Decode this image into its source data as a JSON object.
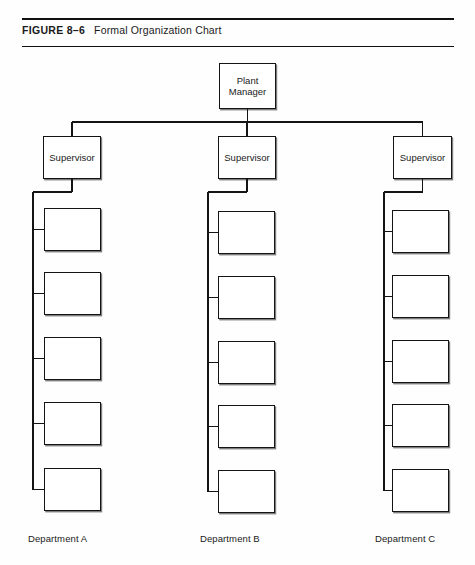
{
  "caption": {
    "figure_number": "FIGURE 8–6",
    "title": "Formal Organization Chart"
  },
  "chart_data": {
    "type": "diagram",
    "diagram_kind": "organization-chart",
    "title": "Formal Organization Chart",
    "orientation": "top-down",
    "root": {
      "id": "plant-manager",
      "label": "Plant\nManager",
      "x": 219,
      "y": 63,
      "w": 57,
      "h": 46
    },
    "levels": [
      {
        "level": 1,
        "name": "supervisors",
        "nodes": [
          {
            "id": "supervisor-a",
            "label": "Supervisor",
            "x": 43,
            "y": 136,
            "w": 58,
            "h": 43
          },
          {
            "id": "supervisor-b",
            "label": "Supervisor",
            "x": 218,
            "y": 136,
            "w": 58,
            "h": 43
          },
          {
            "id": "supervisor-c",
            "label": "Supervisor",
            "x": 393,
            "y": 136,
            "w": 59,
            "h": 43
          }
        ]
      },
      {
        "level": 2,
        "name": "work-units",
        "nodes_per_column": 5,
        "labels_blank": true,
        "columns": [
          {
            "id": "department-a",
            "caption": "Department A",
            "caption_x": 28,
            "caption_y": 533,
            "trunk_x": 33,
            "nodes": [
              {
                "id": "dept-a-unit-1",
                "label": "",
                "x": 44,
                "y": 208,
                "w": 57,
                "h": 43
              },
              {
                "id": "dept-a-unit-2",
                "label": "",
                "x": 44,
                "y": 272,
                "w": 57,
                "h": 43
              },
              {
                "id": "dept-a-unit-3",
                "label": "",
                "x": 44,
                "y": 337,
                "w": 57,
                "h": 43
              },
              {
                "id": "dept-a-unit-4",
                "label": "",
                "x": 44,
                "y": 402,
                "w": 57,
                "h": 43
              },
              {
                "id": "dept-a-unit-5",
                "label": "",
                "x": 44,
                "y": 468,
                "w": 57,
                "h": 43
              }
            ]
          },
          {
            "id": "department-b",
            "caption": "Department B",
            "caption_x": 200,
            "caption_y": 533,
            "trunk_x": 208,
            "nodes": [
              {
                "id": "dept-b-unit-1",
                "label": "",
                "x": 218,
                "y": 211,
                "w": 57,
                "h": 43
              },
              {
                "id": "dept-b-unit-2",
                "label": "",
                "x": 218,
                "y": 276,
                "w": 57,
                "h": 43
              },
              {
                "id": "dept-b-unit-3",
                "label": "",
                "x": 218,
                "y": 341,
                "w": 57,
                "h": 43
              },
              {
                "id": "dept-b-unit-4",
                "label": "",
                "x": 218,
                "y": 405,
                "w": 57,
                "h": 43
              },
              {
                "id": "dept-b-unit-5",
                "label": "",
                "x": 218,
                "y": 470,
                "w": 57,
                "h": 43
              }
            ]
          },
          {
            "id": "department-c",
            "caption": "Department C",
            "caption_x": 375,
            "caption_y": 533,
            "trunk_x": 384,
            "nodes": [
              {
                "id": "dept-c-unit-1",
                "label": "",
                "x": 392,
                "y": 210,
                "w": 57,
                "h": 43
              },
              {
                "id": "dept-c-unit-2",
                "label": "",
                "x": 392,
                "y": 275,
                "w": 57,
                "h": 43
              },
              {
                "id": "dept-c-unit-3",
                "label": "",
                "x": 392,
                "y": 340,
                "w": 57,
                "h": 43
              },
              {
                "id": "dept-c-unit-4",
                "label": "",
                "x": 392,
                "y": 404,
                "w": 57,
                "h": 43
              },
              {
                "id": "dept-c-unit-5",
                "label": "",
                "x": 392,
                "y": 469,
                "w": 57,
                "h": 43
              }
            ]
          }
        ]
      }
    ],
    "connectors": {
      "bus_y": 122,
      "bus_x_start": 72,
      "bus_x_end": 423,
      "line_color": "#141414",
      "line_width": 1.3
    },
    "colors": {
      "line": "#141414",
      "box_border": "#141414",
      "box_fill": "#ffffff",
      "text": "#1a1a1a",
      "page_background": "#fefefe"
    }
  }
}
